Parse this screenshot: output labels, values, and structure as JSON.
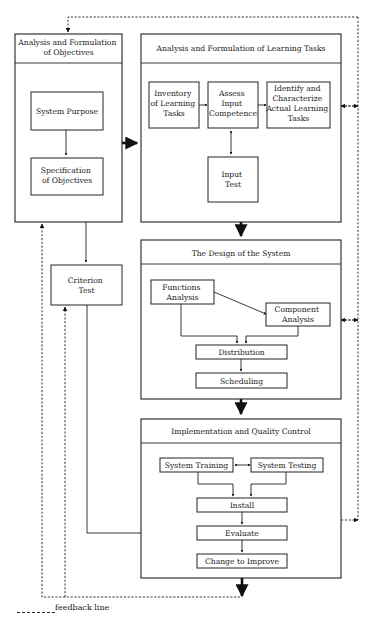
{
  "diagram": {
    "sections": {
      "objectives": {
        "title_lines": [
          "Analysis and Formulation",
          "of Objectives"
        ],
        "items": {
          "system_purpose": [
            "System Purpose"
          ],
          "specification": [
            "Specification",
            "of Objectives"
          ]
        }
      },
      "learning_tasks": {
        "title_lines": [
          "Analysis and Formulation of Learning Tasks"
        ],
        "items": {
          "inventory": [
            "Inventory",
            "of Learning",
            "Tasks"
          ],
          "assess": [
            "Assess",
            "Input",
            "Competence"
          ],
          "identify": [
            "Identify and",
            "Characterize",
            "Actual Learning",
            "Tasks"
          ],
          "input_test": [
            "Input",
            "Test"
          ]
        }
      },
      "criterion_test": [
        "Criterion",
        "Test"
      ],
      "design": {
        "title_lines": [
          "The Design of the System"
        ],
        "items": {
          "functions": [
            "Functions",
            "Analysis"
          ],
          "component": [
            "Component",
            "Analysis"
          ],
          "distribution": [
            "Distribution"
          ],
          "scheduling": [
            "Scheduling"
          ]
        }
      },
      "implementation": {
        "title_lines": [
          "Implementation and Quality Control"
        ],
        "items": {
          "training": [
            "System Training"
          ],
          "testing": [
            "System Testing"
          ],
          "install": [
            "Install"
          ],
          "evaluate": [
            "Evaluate"
          ],
          "change": [
            "Change to Improve"
          ]
        }
      }
    },
    "legend": {
      "label": "feedback line"
    }
  }
}
